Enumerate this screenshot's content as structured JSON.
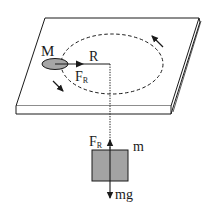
{
  "diagram": {
    "labels": {
      "mass_table": "M",
      "radius": "R",
      "force_table": "F",
      "force_table_sub": "R",
      "force_hanging": "F",
      "force_hanging_sub": "R",
      "mass_hanging": "m",
      "weight": "mg"
    },
    "colors": {
      "stroke": "#1a1a1a",
      "mass_fill": "#a6a6a6",
      "box_fill": "#a3a3a3",
      "background": "#ffffff"
    },
    "elements": [
      "table-plate",
      "circular-orbit-dashed",
      "mass-M-puck",
      "radius-string-with-arrow",
      "rotation-arrows",
      "vertical-string-dotted",
      "hanging-block-m",
      "tension-arrow-up",
      "weight-arrow-down"
    ]
  }
}
